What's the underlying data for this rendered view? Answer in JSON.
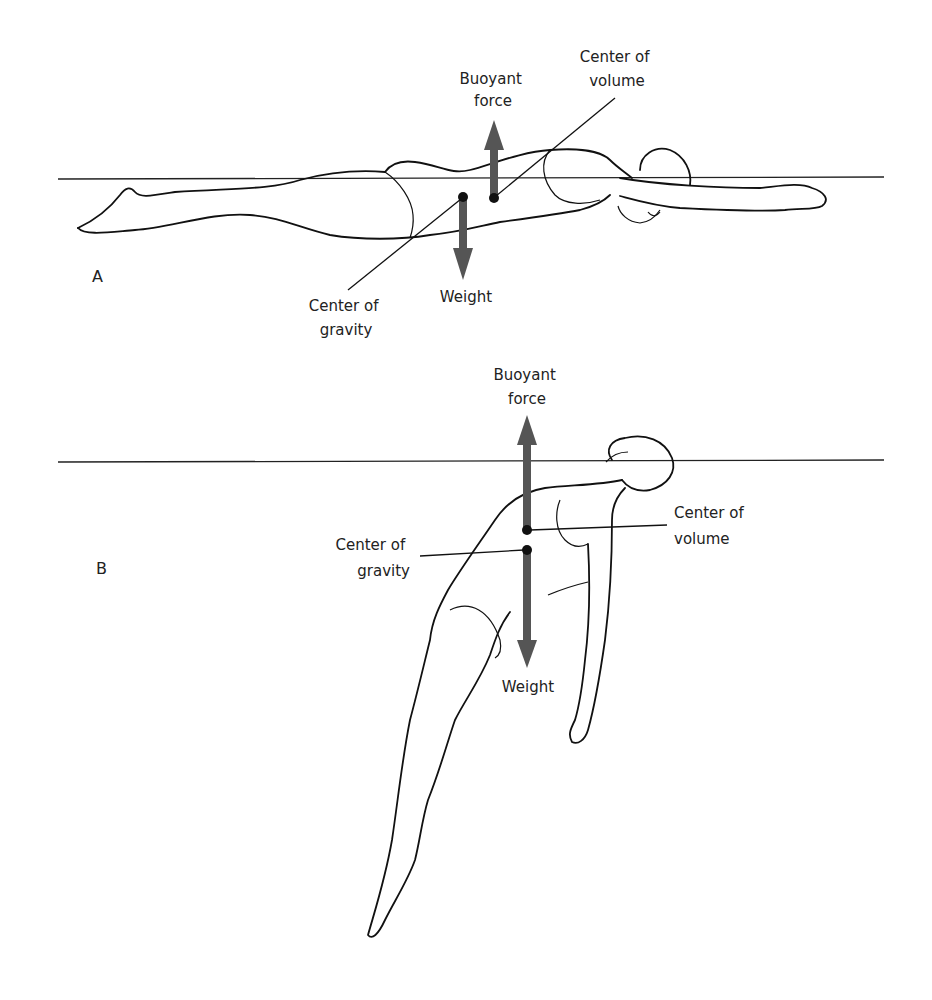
{
  "colors": {
    "arrow": "#555555",
    "ink": "#111111",
    "background": "#ffffff"
  },
  "panel_a": {
    "label": "A",
    "buoyant_force": {
      "line1": "Buoyant",
      "line2": "force"
    },
    "center_of_volume": {
      "line1": "Center of",
      "line2": "volume"
    },
    "center_of_gravity": {
      "line1": "Center of",
      "line2": "gravity"
    },
    "weight": "Weight"
  },
  "panel_b": {
    "label": "B",
    "buoyant_force": {
      "line1": "Buoyant",
      "line2": "force"
    },
    "center_of_volume": {
      "line1": "Center of",
      "line2": "volume"
    },
    "center_of_gravity": {
      "line1": "Center of",
      "line2": "gravity"
    },
    "weight": "Weight"
  }
}
